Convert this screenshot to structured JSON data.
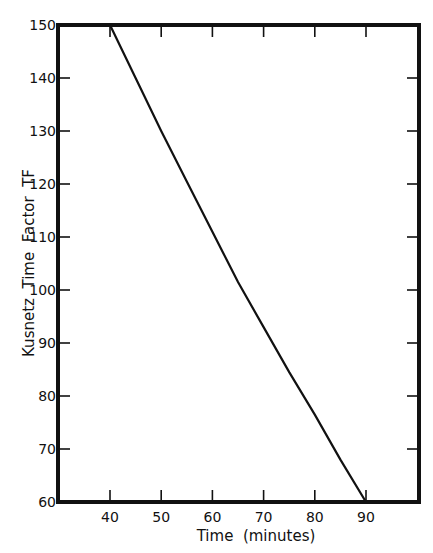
{
  "chart_data": {
    "type": "line",
    "title": "",
    "xlabel": "Time  (minutes)",
    "ylabel": "Kusnetz  Time  Factor  TF",
    "xlim": [
      30,
      100
    ],
    "ylim": [
      60,
      150
    ],
    "x_ticks": [
      40,
      50,
      60,
      70,
      80,
      90
    ],
    "y_ticks": [
      60,
      70,
      80,
      90,
      100,
      110,
      120,
      130,
      140,
      150
    ],
    "grid": false,
    "legend": null,
    "series": [
      {
        "name": "Kusnetz Time Factor",
        "x": [
          40,
          45,
          50,
          55,
          60,
          65,
          70,
          75,
          80,
          85,
          90
        ],
        "y": [
          150,
          140,
          130,
          120.5,
          111,
          101.5,
          93,
          84.5,
          76.5,
          68,
          60
        ]
      }
    ],
    "colors": {
      "line": "#111111",
      "frame": "#111111",
      "background": "#ffffff"
    }
  }
}
